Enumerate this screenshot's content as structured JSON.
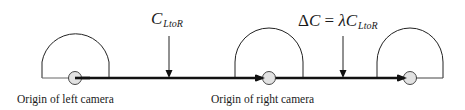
{
  "diagram": {
    "labels": {
      "left_origin": "Origin of left camera",
      "right_origin": "Origin of right camera"
    },
    "annotations": {
      "c_ltor": {
        "main": "C",
        "sub": "LtoR"
      },
      "delta_c": {
        "delta": "Δ",
        "c": "C",
        "equals": " = ",
        "lambda": "λ",
        "c2": "C",
        "sub": "LtoR"
      }
    },
    "nodes": [
      {
        "id": "left-camera",
        "label": "Origin of left camera"
      },
      {
        "id": "right-camera",
        "label": "Origin of right camera"
      },
      {
        "id": "shifted-camera",
        "label": ""
      }
    ],
    "edges": [
      {
        "from": "left-camera",
        "to": "right-camera",
        "label": "C_LtoR"
      },
      {
        "from": "right-camera",
        "to": "shifted-camera",
        "label": "ΔC = λC_LtoR"
      }
    ],
    "colors": {
      "line": "#111111",
      "thin_line": "#555555",
      "origin_fill": "#e2e2e2"
    }
  }
}
